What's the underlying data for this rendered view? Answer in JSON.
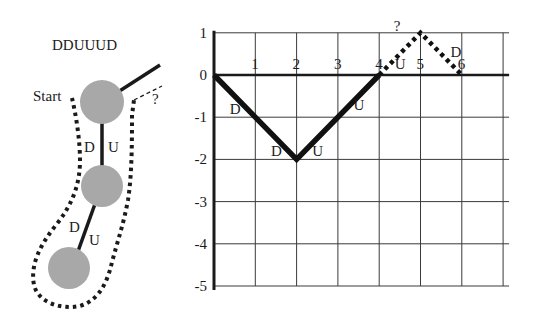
{
  "tree": {
    "title": "DDUUUD",
    "start_label": "Start",
    "question_label": "?",
    "edge_labels": [
      {
        "edge": 1,
        "left": "D",
        "right": "U"
      },
      {
        "edge": 2,
        "left": "D",
        "right": "U"
      }
    ],
    "node_count": 3,
    "node_color": "#a8a8a8"
  },
  "chart_data": {
    "type": "line",
    "title": "",
    "xlabel": "",
    "ylabel": "",
    "xlim": [
      0,
      7
    ],
    "ylim": [
      -5,
      1
    ],
    "grid": true,
    "x_ticks": [
      "1",
      "2",
      "3",
      "4",
      "5",
      "6"
    ],
    "y_ticks": [
      "1",
      "0",
      "-1",
      "-2",
      "-3",
      "-4",
      "-5"
    ],
    "series": [
      {
        "name": "known-path",
        "style": "solid",
        "points": [
          [
            0,
            0
          ],
          [
            2,
            -2
          ],
          [
            4,
            0
          ]
        ],
        "step_labels": [
          {
            "x": 0.5,
            "y": -0.8,
            "text": "D"
          },
          {
            "x": 1.5,
            "y": -1.8,
            "text": "D"
          },
          {
            "x": 2.5,
            "y": -1.8,
            "text": "U"
          },
          {
            "x": 3.5,
            "y": -0.7,
            "text": "U"
          }
        ]
      },
      {
        "name": "guessed-path",
        "style": "dotted",
        "points": [
          [
            4,
            0
          ],
          [
            5,
            1
          ],
          [
            6,
            0
          ]
        ],
        "step_labels": [
          {
            "x": 4.5,
            "y": 0.25,
            "text": "U"
          },
          {
            "x": 5.85,
            "y": 0.55,
            "text": "D"
          }
        ]
      }
    ],
    "annotations": [
      {
        "x": 4.35,
        "y": 1.15,
        "text": "?"
      }
    ]
  }
}
